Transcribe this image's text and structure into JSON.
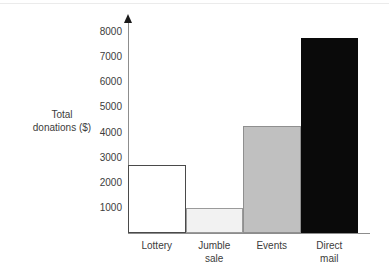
{
  "chart_data": {
    "type": "bar",
    "title": "",
    "xlabel": "",
    "ylabel": "Total donations ($)",
    "categories": [
      "Lottery",
      "Jumble sale",
      "Events",
      "Direct mail"
    ],
    "category_lines": [
      [
        "Lottery"
      ],
      [
        "Jumble",
        "sale"
      ],
      [
        "Events"
      ],
      [
        "Direct",
        "mail"
      ]
    ],
    "values": [
      2700,
      1000,
      4250,
      7750
    ],
    "ylim": [
      0,
      8400
    ],
    "yticks": [
      1000,
      2000,
      3000,
      4000,
      5000,
      6000,
      7000,
      8000
    ],
    "ytick_labels": [
      "1000",
      "2000",
      "3000",
      "4000",
      "5000",
      "6000",
      "7000",
      "8000"
    ],
    "grid": false,
    "legend": "none",
    "bar_colors": [
      "#ffffff",
      "#f2f2f2",
      "#c0c0c0",
      "#0a0a0a"
    ],
    "bar_border_colors": [
      "#4a4a4a",
      "#9a9a9a",
      "#8f8f8f",
      "#0a0a0a"
    ],
    "axis_color": "#8d8d8d",
    "background": "#ffffff"
  },
  "axis": {
    "y_title_line1": "Total",
    "y_title_line2": "donations ($)"
  }
}
